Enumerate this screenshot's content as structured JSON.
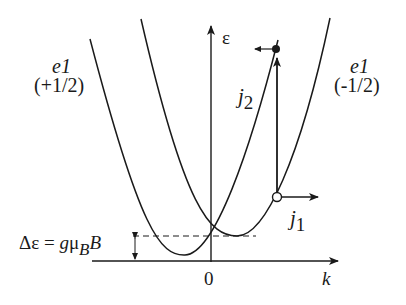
{
  "diagram": {
    "axes": {
      "y_label": "ε",
      "x_label": "k",
      "origin_label": "0"
    },
    "bands": [
      {
        "name": "e1",
        "spin": "(+1/2)"
      },
      {
        "name": "e1",
        "spin": "(-1/2)"
      }
    ],
    "vectors": {
      "j1": {
        "symbol": "j",
        "subscript": "1"
      },
      "j2": {
        "symbol": "j",
        "subscript": "2"
      }
    },
    "splitting": {
      "lhs": "Δε = ",
      "g": "g",
      "mu": "μ",
      "sub": "B",
      "B": "B"
    },
    "colors": {
      "line": "#1a1a1a",
      "background": "#ffffff"
    }
  }
}
